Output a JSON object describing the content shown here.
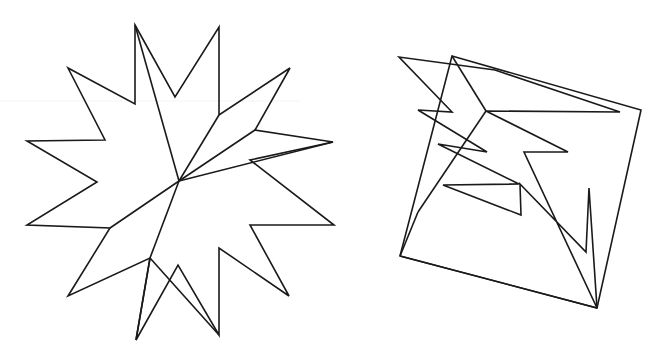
{
  "page": {
    "width": 671,
    "height": 359,
    "background_color": "#ffffff",
    "stroke_color": "#1a1a1a",
    "stroke_width": 1.6,
    "fill": "none"
  },
  "figures": [
    {
      "id": "left-star",
      "name": "jagged-star-figure",
      "label": "Left figure: multi-pointed jagged star",
      "bounds": {
        "x": 24,
        "y": 22,
        "width": 312,
        "height": 320
      },
      "paths": [
        {
          "name": "star-outer-outline",
          "closed": true,
          "points": [
            [
              135,
              25
            ],
            [
              175,
              97
            ],
            [
              219,
              27
            ],
            [
              219,
              115
            ],
            [
              290,
              68
            ],
            [
              255,
              130
            ],
            [
              333,
              142
            ],
            [
              250,
              160
            ],
            [
              334,
              225
            ],
            [
              250,
              225
            ],
            [
              289,
              296
            ],
            [
              219,
              248
            ],
            [
              219,
              335
            ],
            [
              178,
              265
            ],
            [
              136,
              340
            ],
            [
              150,
              258
            ],
            [
              68,
              296
            ],
            [
              110,
              228
            ],
            [
              27,
              225
            ],
            [
              97,
              182
            ],
            [
              27,
              141
            ],
            [
              105,
              140
            ],
            [
              68,
              68
            ],
            [
              135,
              104
            ]
          ]
        },
        {
          "name": "star-inner-fan-spoke-1",
          "closed": false,
          "points": [
            [
              135,
              25
            ],
            [
              179,
              181
            ]
          ]
        },
        {
          "name": "star-inner-fan-spoke-2",
          "closed": false,
          "points": [
            [
              219,
              115
            ],
            [
              179,
              181
            ]
          ]
        },
        {
          "name": "star-inner-fan-spoke-3",
          "closed": false,
          "points": [
            [
              255,
              130
            ],
            [
              179,
              181
            ]
          ]
        },
        {
          "name": "star-inner-fan-spoke-4",
          "closed": false,
          "points": [
            [
              333,
              142
            ],
            [
              179,
              181
            ]
          ]
        },
        {
          "name": "star-inner-lower-chord",
          "closed": false,
          "points": [
            [
              179,
              181
            ],
            [
              110,
              228
            ]
          ]
        },
        {
          "name": "star-inner-lower-right-chord",
          "closed": false,
          "points": [
            [
              179,
              181
            ],
            [
              150,
              258
            ]
          ]
        },
        {
          "name": "star-inner-bottom-chord",
          "closed": false,
          "points": [
            [
              150,
              258
            ],
            [
              219,
              335
            ]
          ]
        },
        {
          "name": "star-inner-bottom-left-chord",
          "closed": false,
          "points": [
            [
              150,
              258
            ],
            [
              136,
              340
            ]
          ]
        }
      ]
    },
    {
      "id": "right-quad",
      "name": "tilted-quadrilateral-figure",
      "label": "Right figure: tilted quadrilateral with inner zig-zag arrow",
      "bounds": {
        "x": 399,
        "y": 55,
        "width": 244,
        "height": 256
      },
      "paths": [
        {
          "name": "quad-outer-outline",
          "closed": true,
          "points": [
            [
              452,
              56
            ],
            [
              641,
              110
            ],
            [
              597,
              308
            ],
            [
              400,
              256
            ]
          ]
        },
        {
          "name": "zigzag-arrow-outline",
          "closed": true,
          "points": [
            [
              495,
              70
            ],
            [
              620,
              112
            ],
            [
              486,
              111
            ],
            [
              568,
              152
            ],
            [
              524,
              152
            ],
            [
              597,
              308
            ],
            [
              589,
              188
            ],
            [
              586,
              252
            ],
            [
              520,
              184
            ],
            [
              521,
              215
            ],
            [
              443,
              185
            ],
            [
              519,
              184
            ],
            [
              438,
              144
            ],
            [
              487,
              152
            ],
            [
              418,
              110
            ],
            [
              452,
              112
            ],
            [
              399,
              57
            ]
          ]
        },
        {
          "name": "quad-inner-chord-top",
          "closed": false,
          "points": [
            [
              452,
              56
            ],
            [
              486,
              111
            ]
          ]
        },
        {
          "name": "quad-inner-chord-left-upper",
          "closed": false,
          "points": [
            [
              486,
              111
            ],
            [
              418,
              212
            ]
          ]
        },
        {
          "name": "quad-inner-chord-left-lower",
          "closed": false,
          "points": [
            [
              418,
              212
            ],
            [
              400,
              256
            ]
          ]
        },
        {
          "name": "quad-inner-chord-bottom",
          "closed": false,
          "points": [
            [
              400,
              256
            ],
            [
              597,
              308
            ]
          ]
        }
      ]
    }
  ],
  "artifacts": {
    "scan_seam_y": 101,
    "scan_seam_color": "#f2f4f6",
    "note": "A faint horizontal scan seam crosses the left half of the image."
  }
}
